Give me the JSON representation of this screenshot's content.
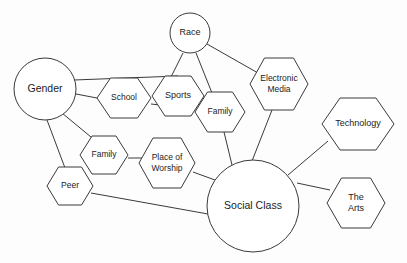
{
  "diagram": {
    "background_color": "#fdfdfd",
    "stroke_color": "#3a3a3a",
    "node_fill": "#ffffff",
    "text_color": "#1b1b1b",
    "nodes": [
      {
        "id": "gender",
        "label": "Gender",
        "lines": [
          "Gender"
        ],
        "shape": "circle",
        "cx": 45,
        "cy": 89,
        "r": 31,
        "font_size": 10.5
      },
      {
        "id": "race",
        "label": "Race",
        "lines": [
          "Race"
        ],
        "shape": "circle",
        "cx": 190,
        "cy": 33,
        "r": 20,
        "font_size": 9
      },
      {
        "id": "social",
        "label": "Social Class",
        "lines": [
          "Social Class"
        ],
        "shape": "circle",
        "cx": 253,
        "cy": 206,
        "r": 46,
        "font_size": 10.5
      },
      {
        "id": "school",
        "label": "School",
        "lines": [
          "School"
        ],
        "shape": "hexagon",
        "cx": 124,
        "cy": 98,
        "rx": 27,
        "ry": 20,
        "font_size": 8.5
      },
      {
        "id": "sports",
        "label": "Sports",
        "lines": [
          "Sports"
        ],
        "shape": "hexagon",
        "cx": 178,
        "cy": 96,
        "rx": 26,
        "ry": 20,
        "font_size": 9
      },
      {
        "id": "family_top",
        "label": "Family",
        "lines": [
          "Family"
        ],
        "shape": "hexagon",
        "cx": 220,
        "cy": 112,
        "rx": 25,
        "ry": 20,
        "font_size": 8.5
      },
      {
        "id": "emedia",
        "label": "Electronic Media",
        "lines": [
          "Electronic",
          "Media"
        ],
        "shape": "hexagon",
        "cx": 279,
        "cy": 84,
        "rx": 29,
        "ry": 26,
        "font_size": 8.5
      },
      {
        "id": "technology",
        "label": "Technology",
        "lines": [
          "Technology"
        ],
        "shape": "hexagon",
        "cx": 358,
        "cy": 124,
        "rx": 36,
        "ry": 26,
        "font_size": 9
      },
      {
        "id": "family_low",
        "label": "Family",
        "lines": [
          "Family"
        ],
        "shape": "hexagon",
        "cx": 104,
        "cy": 155,
        "rx": 24,
        "ry": 19,
        "font_size": 8.5
      },
      {
        "id": "worship",
        "label": "Place of Worship",
        "lines": [
          "Place of",
          "Worship"
        ],
        "shape": "hexagon",
        "cx": 167,
        "cy": 163,
        "rx": 28,
        "ry": 25,
        "font_size": 8.5
      },
      {
        "id": "peer",
        "label": "Peer",
        "lines": [
          "Peer"
        ],
        "shape": "hexagon",
        "cx": 70,
        "cy": 186,
        "rx": 23,
        "ry": 19,
        "font_size": 8.5
      },
      {
        "id": "arts",
        "label": "The Arts",
        "lines": [
          "The",
          "Arts"
        ],
        "shape": "hexagon",
        "cx": 356,
        "cy": 203,
        "rx": 29,
        "ry": 25,
        "font_size": 9
      }
    ],
    "edges": [
      {
        "id": "gender-sports",
        "from": "Gender",
        "to": "Sports",
        "x1": 74,
        "y1": 80,
        "x2": 178,
        "y2": 76
      },
      {
        "id": "gender-school",
        "from": "Gender",
        "to": "School",
        "x1": 76,
        "y1": 94,
        "x2": 97,
        "y2": 98
      },
      {
        "id": "gender-family-lower",
        "from": "Gender",
        "to": "Family",
        "x1": 62,
        "y1": 113,
        "x2": 97,
        "y2": 142
      },
      {
        "id": "gender-peer",
        "from": "Gender",
        "to": "Peer",
        "x1": 47,
        "y1": 120,
        "x2": 65,
        "y2": 168
      },
      {
        "id": "school-sports",
        "from": "School",
        "to": "Sports",
        "x1": 151,
        "y1": 104,
        "x2": 160,
        "y2": 105
      },
      {
        "id": "race-sports",
        "from": "Race",
        "to": "Sports",
        "x1": 183,
        "y1": 53,
        "x2": 171,
        "y2": 77
      },
      {
        "id": "race-family-top",
        "from": "Race",
        "to": "Family",
        "x1": 196,
        "y1": 53,
        "x2": 212,
        "y2": 93
      },
      {
        "id": "race-emedia",
        "from": "Race",
        "to": "Electronic Media",
        "x1": 207,
        "y1": 44,
        "x2": 258,
        "y2": 73
      },
      {
        "id": "sports-family-top",
        "from": "Sports",
        "to": "Family",
        "x1": 199,
        "y1": 104,
        "x2": 205,
        "y2": 107
      },
      {
        "id": "family-top-social",
        "from": "Family",
        "to": "Social Class",
        "x1": 224,
        "y1": 132,
        "x2": 232,
        "y2": 165
      },
      {
        "id": "emedia-social",
        "from": "Electronic Media",
        "to": "Social Class",
        "x1": 272,
        "y1": 110,
        "x2": 252,
        "y2": 161
      },
      {
        "id": "technology-social",
        "from": "Technology",
        "to": "Social Class",
        "x1": 328,
        "y1": 141,
        "x2": 288,
        "y2": 175
      },
      {
        "id": "arts-social",
        "from": "The Arts",
        "to": "Social Class",
        "x1": 330,
        "y1": 190,
        "x2": 297,
        "y2": 183
      },
      {
        "id": "family-lower-worship",
        "from": "Family",
        "to": "Place of Worship",
        "x1": 128,
        "y1": 158,
        "x2": 142,
        "y2": 158
      },
      {
        "id": "worship-social",
        "from": "Place of Worship",
        "to": "Social Class",
        "x1": 193,
        "y1": 172,
        "x2": 215,
        "y2": 180
      },
      {
        "id": "peer-social",
        "from": "Peer",
        "to": "Social Class",
        "x1": 91,
        "y1": 193,
        "x2": 208,
        "y2": 214
      }
    ]
  }
}
